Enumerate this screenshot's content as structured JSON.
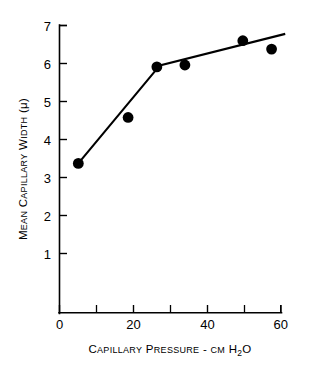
{
  "chart_data": {
    "type": "scatter",
    "title": "",
    "subtitle": "",
    "xlabel": "Capillary Pressure - cm H2O",
    "xlabel_parts": {
      "word1": "C",
      "word1_rest": "APILLARY",
      "word2": "P",
      "word2_rest": "RESSURE",
      "dash": "-",
      "unit_small": "CM",
      "unit_h": "H",
      "unit_sub": "2",
      "unit_o": "O"
    },
    "ylabel": "Mean Capillary Width (μ)",
    "ylabel_parts": {
      "w1_cap": "M",
      "w1_rest": "EAN",
      "w2_cap": "C",
      "w2_rest": "APILLARY",
      "w3_cap": "W",
      "w3_rest": "IDTH",
      "unit": "(μ)"
    },
    "xlim": [
      0,
      60
    ],
    "ylim": [
      0.35,
      7
    ],
    "x_ticks_major": [
      0,
      20,
      40,
      60
    ],
    "x_ticks_major_labels": [
      "0",
      "20",
      "40",
      "60"
    ],
    "x_ticks_minor": [
      10,
      30,
      50
    ],
    "y_ticks_major": [
      1,
      2,
      3,
      4,
      5,
      6,
      7
    ],
    "y_ticks_major_labels": [
      "1",
      "2",
      "3",
      "4",
      "5",
      "6",
      "7"
    ],
    "grid": false,
    "legend": null,
    "series": [
      {
        "name": "Mean capillary width measurements",
        "marker": "filled-circle",
        "marker_color": "#000000",
        "points": [
          {
            "x": 5.1,
            "y": 3.37
          },
          {
            "x": 18.6,
            "y": 4.58
          },
          {
            "x": 26.4,
            "y": 5.91
          },
          {
            "x": 34.0,
            "y": 5.96
          },
          {
            "x": 49.7,
            "y": 6.6
          },
          {
            "x": 57.5,
            "y": 6.38
          }
        ]
      },
      {
        "name": "Fitted two-segment line",
        "type": "line",
        "color": "#000000",
        "points": [
          {
            "x": 5.1,
            "y": 3.37
          },
          {
            "x": 27.2,
            "y": 5.95
          },
          {
            "x": 61.2,
            "y": 6.78
          }
        ]
      }
    ],
    "colors": {
      "axis": "#000000",
      "marker": "#000000",
      "line": "#000000",
      "background": "#ffffff"
    }
  }
}
